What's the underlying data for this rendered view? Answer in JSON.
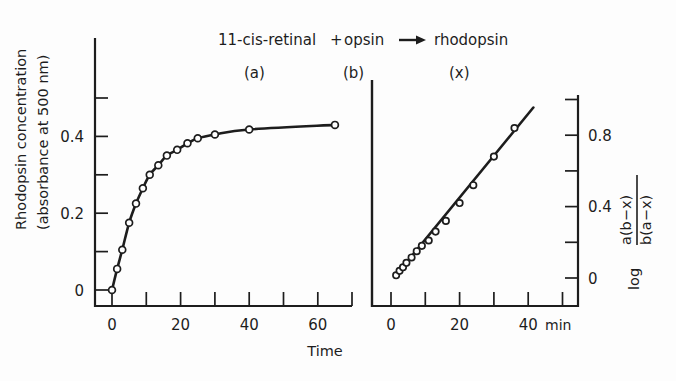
{
  "figure": {
    "reaction_title": "11-cis-retinal + opsin → rhodopsin",
    "reaction_parts": {
      "reactant_a": "11-cis-retinal",
      "plus": "+",
      "reactant_b": "opsin",
      "arrow": "➜",
      "product": "rhodopsin"
    },
    "species_labels": {
      "a": "(a)",
      "b": "(b)",
      "x": "(x)"
    },
    "shared_xlabel": "Time",
    "x_unit": "min"
  },
  "left_panel": {
    "ylabel_line1": "Rhodopsin  concentration",
    "ylabel_line2": "(absorbance at 500 nm)",
    "x_tick_labels": [
      "0",
      "20",
      "40",
      "60"
    ],
    "y_tick_labels": [
      "0",
      "0.2",
      "0.4"
    ]
  },
  "right_panel": {
    "ylabel_log": "log",
    "ylabel_num": "a(b−x)",
    "ylabel_den": "b(a−x)",
    "x_tick_labels": [
      "0",
      "20",
      "40"
    ],
    "y_tick_labels": [
      "0",
      "0.4",
      "0.8"
    ]
  },
  "chart_data": [
    {
      "type": "line",
      "panel": "left",
      "title": "11-cis-retinal + opsin → rhodopsin",
      "xlabel": "Time",
      "ylabel": "Rhodopsin concentration (absorbance at 500 nm)",
      "x_unit": "min",
      "xlim": [
        0,
        72
      ],
      "ylim": [
        0,
        0.56
      ],
      "xticks": [
        0,
        10,
        20,
        30,
        40,
        50,
        60,
        70
      ],
      "xticklabels": {
        "0": "0",
        "20": "20",
        "40": "40",
        "60": "60"
      },
      "yticks": [
        0,
        0.1,
        0.2,
        0.3,
        0.4,
        0.5
      ],
      "yticklabels": {
        "0": "0",
        "0.2": "0.2",
        "0.4": "0.4"
      },
      "grid": false,
      "legend": "none",
      "marker": "open-circle",
      "series": [
        {
          "name": "rhodopsin formation",
          "x": [
            0,
            1.5,
            3,
            5,
            7,
            9,
            11,
            13.5,
            16,
            19,
            22,
            25,
            30,
            40,
            65
          ],
          "y": [
            0.0,
            0.055,
            0.105,
            0.175,
            0.225,
            0.265,
            0.3,
            0.325,
            0.35,
            0.365,
            0.382,
            0.395,
            0.405,
            0.418,
            0.43
          ]
        }
      ]
    },
    {
      "type": "scatter",
      "panel": "right",
      "xlabel": "Time",
      "ylabel": "log a(b−x)/b(a−x)",
      "x_unit": "min",
      "xlim": [
        0,
        52
      ],
      "ylim": [
        0,
        1.0
      ],
      "xticks": [
        0,
        10,
        20,
        30,
        40,
        50
      ],
      "xticklabels": {
        "0": "0",
        "20": "20",
        "40": "40"
      },
      "yticks": [
        0,
        0.2,
        0.4,
        0.6,
        0.8,
        1.0
      ],
      "yticklabels": {
        "0": "0",
        "0.4": "0.4",
        "0.8": "0.8"
      },
      "grid": false,
      "legend": "none",
      "marker": "open-circle",
      "fit_line": {
        "x": [
          1.0,
          41.5
        ],
        "y": [
          0.005,
          0.955
        ],
        "slope": 0.0235
      },
      "series": [
        {
          "name": "second-order kinetic plot",
          "x": [
            1.5,
            2.5,
            3.5,
            4.5,
            6,
            7.5,
            9,
            11,
            13,
            16,
            20,
            24,
            30,
            36
          ],
          "y": [
            0.015,
            0.04,
            0.06,
            0.085,
            0.115,
            0.15,
            0.18,
            0.21,
            0.26,
            0.32,
            0.42,
            0.52,
            0.68,
            0.84
          ]
        }
      ]
    }
  ]
}
